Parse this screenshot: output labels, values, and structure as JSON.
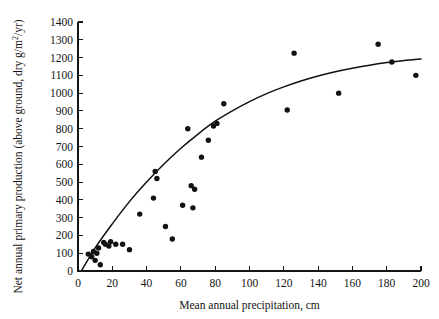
{
  "chart_data": {
    "type": "scatter",
    "title": "",
    "xlabel": "Mean annual precipitation, cm",
    "ylabel": "Net annual primary production (above ground, dry g/m",
    "ylabel_sup": "2",
    "ylabel_tail": "/yr)",
    "xlim": [
      0,
      200
    ],
    "ylim": [
      0,
      1400
    ],
    "grid": false,
    "legend": false,
    "xticks": [
      0,
      20,
      40,
      60,
      80,
      100,
      120,
      140,
      160,
      180,
      200
    ],
    "xtick_labels": [
      "0",
      "20",
      "40",
      "60",
      "80",
      "100",
      "120",
      "140",
      "160",
      "180",
      "200"
    ],
    "yticks": [
      0,
      100,
      200,
      300,
      400,
      500,
      600,
      700,
      800,
      900,
      1000,
      1100,
      1200,
      1300,
      1400
    ],
    "ytick_labels": [
      "0",
      "100",
      "200",
      "300",
      "400",
      "500",
      "600",
      "700",
      "800",
      "900",
      "1000",
      "1100",
      "1200",
      "1300",
      "1400"
    ],
    "points": [
      {
        "x": 6,
        "y": 95
      },
      {
        "x": 8,
        "y": 80
      },
      {
        "x": 9,
        "y": 110
      },
      {
        "x": 10,
        "y": 60
      },
      {
        "x": 11,
        "y": 100
      },
      {
        "x": 12,
        "y": 130
      },
      {
        "x": 13,
        "y": 35
      },
      {
        "x": 15,
        "y": 160
      },
      {
        "x": 16,
        "y": 150
      },
      {
        "x": 18,
        "y": 140
      },
      {
        "x": 19,
        "y": 165
      },
      {
        "x": 22,
        "y": 150
      },
      {
        "x": 26,
        "y": 150
      },
      {
        "x": 30,
        "y": 120
      },
      {
        "x": 36,
        "y": 320
      },
      {
        "x": 44,
        "y": 410
      },
      {
        "x": 45,
        "y": 560
      },
      {
        "x": 46,
        "y": 520
      },
      {
        "x": 51,
        "y": 250
      },
      {
        "x": 55,
        "y": 180
      },
      {
        "x": 61,
        "y": 370
      },
      {
        "x": 64,
        "y": 800
      },
      {
        "x": 66,
        "y": 480
      },
      {
        "x": 67,
        "y": 355
      },
      {
        "x": 68,
        "y": 460
      },
      {
        "x": 72,
        "y": 640
      },
      {
        "x": 76,
        "y": 735
      },
      {
        "x": 79,
        "y": 815
      },
      {
        "x": 81,
        "y": 830
      },
      {
        "x": 85,
        "y": 940
      },
      {
        "x": 122,
        "y": 905
      },
      {
        "x": 126,
        "y": 1225
      },
      {
        "x": 152,
        "y": 1000
      },
      {
        "x": 175,
        "y": 1275
      },
      {
        "x": 183,
        "y": 1175
      },
      {
        "x": 197,
        "y": 1100
      }
    ],
    "fit_curve": {
      "label": "saturating fit",
      "points": [
        {
          "x": 2,
          "y": 0
        },
        {
          "x": 10,
          "y": 130
        },
        {
          "x": 20,
          "y": 265
        },
        {
          "x": 30,
          "y": 390
        },
        {
          "x": 40,
          "y": 500
        },
        {
          "x": 50,
          "y": 600
        },
        {
          "x": 60,
          "y": 690
        },
        {
          "x": 70,
          "y": 770
        },
        {
          "x": 80,
          "y": 842
        },
        {
          "x": 90,
          "y": 900
        },
        {
          "x": 100,
          "y": 952
        },
        {
          "x": 110,
          "y": 997
        },
        {
          "x": 120,
          "y": 1035
        },
        {
          "x": 130,
          "y": 1068
        },
        {
          "x": 140,
          "y": 1096
        },
        {
          "x": 150,
          "y": 1120
        },
        {
          "x": 160,
          "y": 1140
        },
        {
          "x": 170,
          "y": 1157
        },
        {
          "x": 180,
          "y": 1172
        },
        {
          "x": 190,
          "y": 1183
        },
        {
          "x": 200,
          "y": 1192
        }
      ]
    }
  },
  "axes": {
    "x_axis_name": "mean-annual-precipitation",
    "y_axis_name": "net-annual-primary-production"
  }
}
